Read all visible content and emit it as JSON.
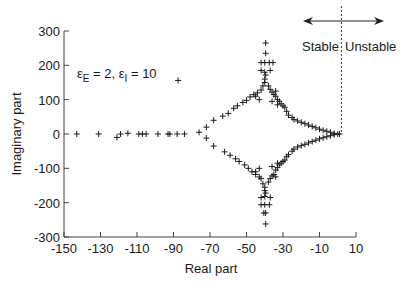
{
  "chart_data": {
    "type": "scatter",
    "title": "",
    "xlabel": "Real part",
    "ylabel": "Imaginary part",
    "xlim": [
      -150,
      10
    ],
    "ylim": [
      -300,
      300
    ],
    "grid": false,
    "legend": null,
    "x_ticks": [
      -150,
      -130,
      -110,
      -90,
      -70,
      -50,
      -30,
      -10,
      10
    ],
    "y_ticks": [
      300,
      200,
      100,
      0,
      -100,
      -200,
      -300
    ],
    "x_tick_labels": [
      "-150",
      "-130",
      "-110",
      "-90",
      "-70",
      "-50",
      "-30",
      "-10",
      "10"
    ],
    "y_tick_labels": [
      "300",
      "200",
      "100",
      "0",
      "-100",
      "-200",
      "-300"
    ],
    "annotation": {
      "eps_E_label": "ε",
      "eps_E_sub": "E",
      "eps_E_value": " = 2, ",
      "eps_I_label": "ε",
      "eps_I_sub": "I",
      "eps_I_value": " = 10"
    },
    "stability_boundary_x": 2,
    "stable_label": "Stable",
    "unstable_label": "Unstable",
    "marker": "+",
    "series": [
      {
        "name": "eigenvalues",
        "points": [
          [
            -143,
            0
          ],
          [
            -131,
            0
          ],
          [
            -121,
            -10
          ],
          [
            -119,
            0
          ],
          [
            -115,
            2
          ],
          [
            -109,
            0
          ],
          [
            -107,
            0
          ],
          [
            -105,
            0
          ],
          [
            -98.5,
            0
          ],
          [
            -93,
            0
          ],
          [
            -92,
            0
          ],
          [
            -88,
            0
          ],
          [
            -84,
            0
          ],
          [
            -87.5,
            156
          ],
          [
            -76,
            5
          ],
          [
            -72,
            20
          ],
          [
            -72,
            -12
          ],
          [
            -68,
            -35
          ],
          [
            -68,
            40
          ],
          [
            -63,
            52
          ],
          [
            -62,
            -52
          ],
          [
            -60,
            60
          ],
          [
            -59,
            -62
          ],
          [
            -57,
            75
          ],
          [
            -56,
            -72
          ],
          [
            -55,
            82
          ],
          [
            -54,
            -80
          ],
          [
            -52,
            92
          ],
          [
            -51,
            -90
          ],
          [
            -50,
            98
          ],
          [
            -49,
            -100
          ],
          [
            -48,
            108
          ],
          [
            -47,
            -110
          ],
          [
            -46,
            115
          ],
          [
            -45,
            -118
          ],
          [
            -44,
            120
          ],
          [
            -43,
            -125
          ],
          [
            -42,
            128
          ],
          [
            -42,
            -130
          ],
          [
            -41,
            140
          ],
          [
            -41,
            -145
          ],
          [
            -40,
            150
          ],
          [
            -40,
            -155
          ],
          [
            -40,
            160
          ],
          [
            -40,
            -165
          ],
          [
            -39.5,
            172
          ],
          [
            -39.5,
            -172
          ],
          [
            -40,
            180
          ],
          [
            -40,
            -182
          ],
          [
            -42,
            208
          ],
          [
            -40,
            208
          ],
          [
            -37.5,
            208
          ],
          [
            -35.5,
            208
          ],
          [
            -42,
            -206
          ],
          [
            -40,
            -206
          ],
          [
            -37.5,
            -206
          ],
          [
            -42,
            185
          ],
          [
            -42,
            -185
          ],
          [
            -37,
            185
          ],
          [
            -37,
            -185
          ],
          [
            -39.5,
            235
          ],
          [
            -39.5,
            -230
          ],
          [
            -39.5,
            265
          ],
          [
            -39.5,
            -262
          ],
          [
            -40.5,
            -230
          ],
          [
            -38,
            140
          ],
          [
            -38,
            -140
          ],
          [
            -37,
            130
          ],
          [
            -37,
            -130
          ],
          [
            -36,
            122
          ],
          [
            -36,
            -122
          ],
          [
            -35,
            115
          ],
          [
            -35,
            -118
          ],
          [
            -34,
            110
          ],
          [
            -34,
            -105
          ],
          [
            -33,
            100
          ],
          [
            -33,
            -98
          ],
          [
            -32,
            95
          ],
          [
            -32,
            -90
          ],
          [
            -31,
            88
          ],
          [
            -31,
            -85
          ],
          [
            -30,
            82
          ],
          [
            -30,
            -80
          ],
          [
            -29,
            78
          ],
          [
            -29,
            -76
          ],
          [
            -34,
            125
          ],
          [
            -34,
            -125
          ],
          [
            -36,
            95
          ],
          [
            -36,
            -95
          ],
          [
            -33,
            85
          ],
          [
            -33,
            -85
          ],
          [
            -28,
            66
          ],
          [
            -28,
            -66
          ],
          [
            -27,
            55
          ],
          [
            -27,
            -60
          ],
          [
            -25,
            48
          ],
          [
            -25,
            -50
          ],
          [
            -24,
            42
          ],
          [
            -24,
            -44
          ],
          [
            -22,
            38
          ],
          [
            -22,
            -38
          ],
          [
            -20,
            34
          ],
          [
            -20,
            -34
          ],
          [
            -18,
            30
          ],
          [
            -18,
            -30
          ],
          [
            -16,
            26
          ],
          [
            -16,
            -26
          ],
          [
            -14,
            22
          ],
          [
            -14,
            -22
          ],
          [
            -12,
            18
          ],
          [
            -12,
            -18
          ],
          [
            -10,
            14
          ],
          [
            -10,
            -14
          ],
          [
            -8,
            11
          ],
          [
            -8,
            -11
          ],
          [
            -6,
            8
          ],
          [
            -6,
            -8
          ],
          [
            -4,
            5
          ],
          [
            -4,
            -5
          ],
          [
            -2,
            2
          ],
          [
            -2,
            -2
          ],
          [
            0,
            0
          ],
          [
            1,
            0
          ],
          [
            -45,
            110
          ],
          [
            -45,
            -110
          ],
          [
            -43,
            100
          ],
          [
            -43,
            -100
          ]
        ]
      }
    ]
  }
}
